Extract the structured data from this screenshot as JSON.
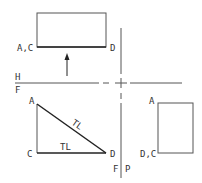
{
  "diagram": {
    "type": "orthographic-projection",
    "colors": {
      "line": "#222222",
      "thin": "#555555",
      "text": "#333333"
    },
    "top_view": {
      "rect": {
        "x": 37,
        "y": 13,
        "w": 69,
        "h": 34
      },
      "labels": {
        "left": "A,C",
        "right": "D"
      }
    },
    "arrow": {
      "x": 67,
      "y1": 76,
      "y2": 55
    },
    "fold_lines": {
      "horizontal": {
        "y": 83,
        "label_top": "H",
        "label_bottom": "F"
      },
      "vertical": {
        "x": 121,
        "label_left": "F",
        "label_right": "P"
      }
    },
    "front_view": {
      "points": {
        "A": [
          37,
          104
        ],
        "C": [
          37,
          153
        ],
        "D": [
          106,
          153
        ]
      },
      "labels": {
        "A": "A",
        "C": "C",
        "D": "D",
        "hyp": "TL",
        "base": "TL"
      }
    },
    "side_view": {
      "rect": {
        "x": 158,
        "y": 103,
        "w": 35,
        "h": 50
      },
      "labels": {
        "top": "A",
        "bottom": "D,C"
      }
    }
  }
}
